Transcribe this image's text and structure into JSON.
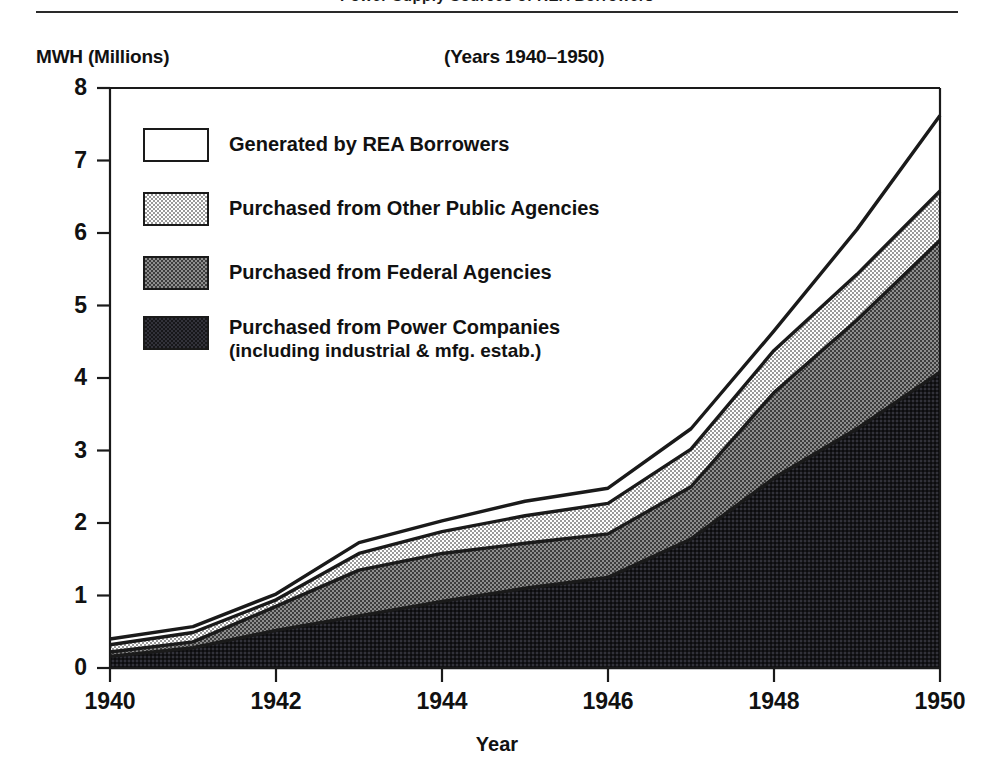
{
  "header": {
    "cropped_title_remnant": "Power Supply Sources of REA Borrowers",
    "y_axis_unit_label": "MWH (Millions)",
    "subtitle": "(Years 1940–1950)"
  },
  "legend": {
    "items": [
      {
        "label": "Generated by REA Borrowers",
        "sublabel": "",
        "swatch": "white-open-box",
        "fill": "#ffffff"
      },
      {
        "label": "Purchased from Other Public Agencies",
        "sublabel": "",
        "swatch": "light-stipple-box",
        "fill": "#d8d8d8"
      },
      {
        "label": "Purchased from Federal Agencies",
        "sublabel": "",
        "swatch": "medium-gray-box",
        "fill": "#787878"
      },
      {
        "label": "Purchased from Power Companies",
        "sublabel": "(including industrial & mfg. estab.)",
        "swatch": "dark-box",
        "fill": "#1d1d1d"
      }
    ]
  },
  "axes": {
    "y_ticks": [
      "8",
      "7",
      "6",
      "5",
      "4",
      "3",
      "2",
      "1",
      "0"
    ],
    "x_ticks": [
      "1940",
      "1942",
      "1944",
      "1946",
      "1948",
      "1950"
    ],
    "x_title": "Year"
  },
  "chart_data": {
    "type": "area",
    "title": "Power Supply Sources of REA Borrowers",
    "subtitle": "(Years 1940–1950)",
    "xlabel": "Year",
    "ylabel": "MWH (Millions)",
    "ylim": [
      0,
      8
    ],
    "xlim": [
      1940,
      1950
    ],
    "grid": false,
    "stacked": true,
    "legend_position": "inside-upper-left",
    "x": [
      1940,
      1941,
      1942,
      1943,
      1944,
      1945,
      1946,
      1947,
      1948,
      1949,
      1950
    ],
    "series": [
      {
        "name": "Purchased from Power Companies (including industrial & mfg. estab.)",
        "fill": "#1d1d1d",
        "values": [
          0.16,
          0.28,
          0.52,
          0.72,
          0.92,
          1.1,
          1.25,
          1.78,
          2.62,
          3.3,
          4.08
        ]
      },
      {
        "name": "Purchased from Federal Agencies",
        "fill": "#787878",
        "values": [
          0.06,
          0.08,
          0.33,
          0.63,
          0.66,
          0.62,
          0.6,
          0.72,
          1.18,
          1.5,
          1.82
        ]
      },
      {
        "name": "Purchased from Other Public Agencies",
        "fill": "#d8d8d8",
        "values": [
          0.1,
          0.13,
          0.09,
          0.23,
          0.3,
          0.38,
          0.42,
          0.52,
          0.58,
          0.63,
          0.68
        ]
      },
      {
        "name": "Generated by REA Borrowers",
        "fill": "#ffffff",
        "values": [
          0.08,
          0.08,
          0.08,
          0.15,
          0.15,
          0.2,
          0.21,
          0.28,
          0.27,
          0.62,
          1.04
        ]
      }
    ],
    "cumulative_totals": [
      0.4,
      0.57,
      1.02,
      1.73,
      2.03,
      2.3,
      2.48,
      3.3,
      4.65,
      6.05,
      7.62
    ]
  },
  "style": {
    "ink": "#1a1a1a",
    "background": "#ffffff"
  }
}
